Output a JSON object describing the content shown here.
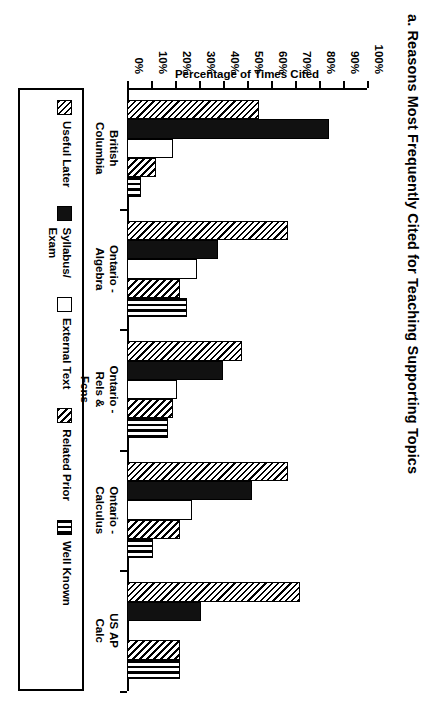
{
  "chart": {
    "title": "a. Reasons Most Frequently Cited for Teaching Supporting Topics",
    "value_axis_title": "Percentage of Times Cited"
  },
  "chart_data": {
    "type": "bar",
    "title": "a. Reasons Most Frequently Cited for Teaching Supporting Topics",
    "orientation": "horizontal",
    "xlabel": "",
    "ylabel": "Percentage of Times Cited",
    "ylim": [
      0,
      100
    ],
    "yticks": [
      "0%",
      "10%",
      "20%",
      "30%",
      "40%",
      "50%",
      "60%",
      "70%",
      "80%",
      "90%",
      "100%"
    ],
    "ytick_values": [
      0,
      10,
      20,
      30,
      40,
      50,
      60,
      70,
      80,
      90,
      100
    ],
    "grid": false,
    "legend_position": "bottom",
    "categories": [
      "British\nColumbia",
      "Ontario -\nAlgebra",
      "Ontario -\nRels &\nFcns",
      "Ontario -\nCalculus",
      "US AP\nCalc"
    ],
    "series": [
      {
        "name": "Useful  Later",
        "pattern": "diagonal-hatch",
        "values": [
          55,
          67,
          48,
          67,
          72
        ]
      },
      {
        "name": "Syllabus/\nExam",
        "pattern": "solid-black",
        "values": [
          84,
          38,
          40,
          52,
          31
        ]
      },
      {
        "name": "External  Text",
        "pattern": "blank-white",
        "values": [
          19,
          29,
          21,
          27,
          0
        ]
      },
      {
        "name": "Related  Prior",
        "pattern": "diagonal-hatch-dense",
        "values": [
          12,
          22,
          19,
          22,
          22
        ]
      },
      {
        "name": "Well Known",
        "pattern": "vertical-lines",
        "values": [
          6,
          25,
          17,
          11,
          22
        ]
      }
    ]
  },
  "legend": {
    "items": [
      {
        "label": "Useful  Later",
        "swatch": "diagonal-hatch-swatch"
      },
      {
        "label": "Syllabus/\nExam",
        "swatch": "solid-black-swatch"
      },
      {
        "label": "External  Text",
        "swatch": "blank-white-swatch"
      },
      {
        "label": "Related  Prior",
        "swatch": "diagonal-hatch-dense-swatch"
      },
      {
        "label": "Well Known",
        "swatch": "vertical-lines-swatch"
      }
    ]
  },
  "colors": {
    "ink": "#000000",
    "paper": "#ffffff",
    "solid_series": "#111111"
  }
}
